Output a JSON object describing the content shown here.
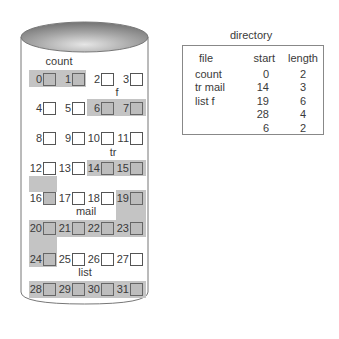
{
  "disk": {
    "fill_color": "#c4c4c4",
    "file_labels": [
      {
        "name": "count",
        "x": 58,
        "y": 56
      },
      {
        "name": "f",
        "x": 117,
        "y": 87
      },
      {
        "name": "tr",
        "x": 113,
        "y": 147
      },
      {
        "name": "mail",
        "x": 86,
        "y": 206
      },
      {
        "name": "list",
        "x": 85,
        "y": 267
      }
    ],
    "blocks": [
      {
        "n": "0",
        "used": true
      },
      {
        "n": "1",
        "used": true
      },
      {
        "n": "2",
        "used": false
      },
      {
        "n": "3",
        "used": false
      },
      {
        "n": "4",
        "used": false
      },
      {
        "n": "5",
        "used": false
      },
      {
        "n": "6",
        "used": true
      },
      {
        "n": "7",
        "used": true
      },
      {
        "n": "8",
        "used": false
      },
      {
        "n": "9",
        "used": false
      },
      {
        "n": "10",
        "used": false
      },
      {
        "n": "11",
        "used": false
      },
      {
        "n": "12",
        "used": false
      },
      {
        "n": "13",
        "used": false
      },
      {
        "n": "14",
        "used": true
      },
      {
        "n": "15",
        "used": true
      },
      {
        "n": "16",
        "used": true
      },
      {
        "n": "17",
        "used": false
      },
      {
        "n": "18",
        "used": false
      },
      {
        "n": "19",
        "used": true
      },
      {
        "n": "20",
        "used": true
      },
      {
        "n": "21",
        "used": true
      },
      {
        "n": "22",
        "used": true
      },
      {
        "n": "23",
        "used": true
      },
      {
        "n": "24",
        "used": true
      },
      {
        "n": "25",
        "used": false
      },
      {
        "n": "26",
        "used": false
      },
      {
        "n": "27",
        "used": false
      },
      {
        "n": "28",
        "used": true
      },
      {
        "n": "29",
        "used": true
      },
      {
        "n": "30",
        "used": true
      },
      {
        "n": "31",
        "used": true
      }
    ]
  },
  "directory": {
    "title": "directory",
    "headers": {
      "file": "file",
      "start": "start",
      "length": "length"
    },
    "files": [
      "count",
      "tr mail",
      "list f",
      "",
      ""
    ],
    "starts": [
      "0",
      "14",
      "19",
      "28",
      "6"
    ],
    "lengths": [
      "2",
      "3",
      "6",
      "4",
      "2"
    ]
  }
}
